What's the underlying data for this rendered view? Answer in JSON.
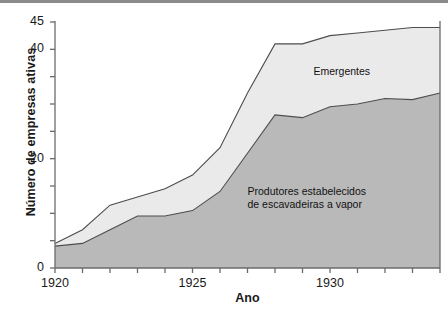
{
  "figure": {
    "background_color": "#ffffff",
    "top_rule_color": "#8b8b8b"
  },
  "axis_titles": {
    "y": "Número de empresas ativas",
    "x": "Ano"
  },
  "series_labels": {
    "emergentes": "Emergentes",
    "estabelecidos_line1": "Produtores estabelecidos",
    "estabelecidos_line2": "de escavadeiras a vapor"
  },
  "colors": {
    "established_fill": "#b9b9b9",
    "emerging_fill": "#eaeaea",
    "line": "#4d4d4d",
    "axis": "#6b6b6b",
    "text": "#1a1a1a"
  },
  "chart_data": {
    "type": "area",
    "title": "",
    "subtitle": "",
    "xlabel": "Ano",
    "ylabel": "Número de empresas ativas",
    "xlim": [
      1920,
      1934
    ],
    "ylim": [
      0,
      45
    ],
    "grid": false,
    "stacked": true,
    "legend_position": "inline-annotation",
    "x": [
      1920,
      1921,
      1922,
      1923,
      1924,
      1925,
      1926,
      1927,
      1928,
      1929,
      1930,
      1931,
      1932,
      1933,
      1934
    ],
    "xticks": [
      1920,
      1921,
      1922,
      1923,
      1924,
      1925,
      1926,
      1927,
      1928,
      1929,
      1930,
      1931,
      1932,
      1933,
      1934
    ],
    "xtick_labels_shown": [
      "1920",
      "1925",
      "1930"
    ],
    "xtick_labels_shown_values": [
      1920,
      1925,
      1930
    ],
    "yticks": [
      0,
      5,
      10,
      15,
      20,
      25,
      30,
      35,
      40,
      45
    ],
    "ytick_labels_shown": [
      "0",
      "20",
      "40",
      "45"
    ],
    "ytick_labels_shown_values": [
      0,
      20,
      40,
      45
    ],
    "series": [
      {
        "name": "Produtores estabelecidos de escavadeiras a vapor",
        "fill": "#b9b9b9",
        "values": [
          4,
          4.5,
          7,
          9.5,
          9.5,
          10.5,
          14,
          21,
          28,
          27.5,
          29.5,
          30,
          31,
          30.8,
          32
        ]
      },
      {
        "name": "Emergentes",
        "fill": "#eaeaea",
        "values": [
          0.5,
          2.5,
          4.5,
          3.5,
          5,
          6.5,
          8,
          11,
          13,
          13.5,
          13,
          13,
          12.5,
          13.2,
          12
        ]
      }
    ],
    "totals": [
      4.5,
      7,
      11.5,
      13,
      14.5,
      17,
      22,
      32,
      41,
      41,
      42.5,
      43,
      43.5,
      44,
      44
    ]
  }
}
